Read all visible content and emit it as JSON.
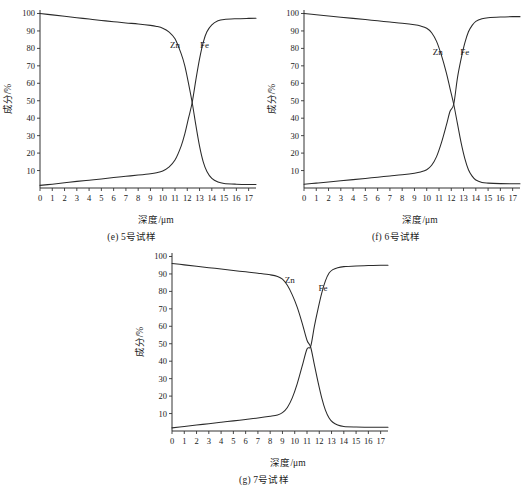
{
  "figure": {
    "background_color": "#ffffff",
    "line_color": "#2a2a2a",
    "panels": [
      "e",
      "f",
      "g"
    ]
  },
  "chart_data": [
    {
      "id": "e",
      "type": "line",
      "title": "",
      "caption": "(e) 5号试样",
      "xlabel": "深度/μm",
      "ylabel": "成分/%",
      "xlim": [
        0,
        17.6
      ],
      "ylim": [
        0,
        102
      ],
      "xticks": [
        0,
        1,
        2,
        3,
        4,
        5,
        6,
        7,
        8,
        9,
        10,
        11,
        12,
        13,
        14,
        15,
        16,
        17
      ],
      "xticklabels": [
        "0",
        "1",
        "2",
        "3",
        "4",
        "5",
        "6",
        "7",
        "8",
        "9",
        "10",
        "11",
        "12",
        "13",
        "14",
        "15",
        "16",
        "17"
      ],
      "yticks": [
        10,
        20,
        30,
        40,
        50,
        60,
        70,
        80,
        90,
        100
      ],
      "yticklabels": [
        "10",
        "20",
        "30",
        "40",
        "50",
        "60",
        "70",
        "80",
        "90",
        "100"
      ],
      "grid": false,
      "legend_position": "inline-annotation",
      "crossover": {
        "x": 12.4,
        "y": 49
      },
      "series": [
        {
          "name": "Zn",
          "label_position": {
            "x": 11.0,
            "y": 80
          },
          "x": [
            0,
            1,
            2,
            3,
            4,
            5,
            6,
            7,
            8,
            9,
            9.5,
            10,
            10.5,
            11,
            11.5,
            11.8,
            12.1,
            12.4,
            12.7,
            13,
            13.3,
            13.6,
            14,
            14.5,
            15,
            16,
            17,
            17.6
          ],
          "values": [
            100,
            99.2,
            98.4,
            97.6,
            96.8,
            96.0,
            95.3,
            94.6,
            94.0,
            93.2,
            92.6,
            91.6,
            89.5,
            85.5,
            77.0,
            70.0,
            60.0,
            49.0,
            36.0,
            24.0,
            15.0,
            9.5,
            5.5,
            3.4,
            2.6,
            2.2,
            2.0,
            2.0
          ]
        },
        {
          "name": "Fe",
          "label_position": {
            "x": 13.4,
            "y": 80
          },
          "x": [
            0,
            1,
            2,
            3,
            4,
            5,
            6,
            7,
            8,
            9,
            9.5,
            10,
            10.5,
            11,
            11.5,
            11.8,
            12.1,
            12.4,
            12.7,
            13,
            13.3,
            13.6,
            14,
            14.5,
            15,
            16,
            17,
            17.6
          ],
          "values": [
            1.5,
            2.2,
            3.0,
            3.8,
            4.5,
            5.2,
            6.0,
            6.7,
            7.4,
            8.2,
            8.8,
            9.8,
            12.0,
            16.0,
            24.0,
            31.0,
            40.0,
            49.0,
            62.0,
            74.0,
            83.5,
            89.5,
            93.5,
            95.8,
            96.6,
            97.0,
            97.2,
            97.3
          ]
        }
      ]
    },
    {
      "id": "f",
      "type": "line",
      "title": "",
      "caption": "(f) 6号试样",
      "xlabel": "深度/μm",
      "ylabel": "成分/%",
      "xlim": [
        0,
        17.6
      ],
      "ylim": [
        0,
        102
      ],
      "xticks": [
        0,
        1,
        2,
        3,
        4,
        5,
        6,
        7,
        8,
        9,
        10,
        11,
        12,
        13,
        14,
        15,
        16,
        17
      ],
      "xticklabels": [
        "0",
        "1",
        "2",
        "3",
        "4",
        "5",
        "6",
        "7",
        "8",
        "9",
        "10",
        "11",
        "12",
        "13",
        "14",
        "15",
        "16",
        "17"
      ],
      "yticks": [
        10,
        20,
        30,
        40,
        50,
        60,
        70,
        80,
        90,
        100
      ],
      "yticklabels": [
        "10",
        "20",
        "30",
        "40",
        "50",
        "60",
        "70",
        "80",
        "90",
        "100"
      ],
      "grid": false,
      "legend_position": "inline-annotation",
      "crossover": {
        "x": 12.2,
        "y": 48
      },
      "series": [
        {
          "name": "Zn",
          "label_position": {
            "x": 10.9,
            "y": 76
          },
          "x": [
            0,
            1,
            2,
            3,
            4,
            5,
            6,
            7,
            8,
            9,
            9.5,
            10,
            10.4,
            10.8,
            11.2,
            11.6,
            11.9,
            12.2,
            12.5,
            12.8,
            13.1,
            13.4,
            13.7,
            14,
            14.5,
            15,
            16,
            17,
            17.6
          ],
          "values": [
            100,
            99.3,
            98.6,
            97.9,
            97.2,
            96.5,
            95.8,
            95.1,
            94.4,
            93.5,
            92.8,
            91.5,
            89.0,
            84.0,
            76.0,
            66.0,
            57.0,
            48.0,
            37.0,
            26.0,
            17.0,
            10.5,
            6.8,
            4.6,
            3.2,
            2.8,
            2.5,
            2.4,
            2.4
          ]
        },
        {
          "name": "Fe",
          "label_position": {
            "x": 13.1,
            "y": 76
          },
          "x": [
            0,
            1,
            2,
            3,
            4,
            5,
            6,
            7,
            8,
            9,
            9.5,
            10,
            10.4,
            10.8,
            11.2,
            11.6,
            11.9,
            12.2,
            12.5,
            12.8,
            13.1,
            13.4,
            13.7,
            14,
            14.5,
            15,
            16,
            17,
            17.6
          ],
          "values": [
            2.2,
            2.8,
            3.4,
            4.1,
            4.8,
            5.5,
            6.2,
            6.9,
            7.6,
            8.5,
            9.2,
            10.5,
            13.0,
            18.0,
            26.0,
            36.0,
            44.0,
            48.0,
            63.0,
            74.0,
            83.0,
            89.5,
            93.2,
            95.5,
            97.0,
            97.6,
            98.0,
            98.2,
            98.2
          ]
        }
      ]
    },
    {
      "id": "g",
      "type": "line",
      "title": "",
      "caption": "(g) 7号试样",
      "xlabel": "深度/μm",
      "ylabel": "成分/%",
      "xlim": [
        0,
        17.6
      ],
      "ylim": [
        0,
        102
      ],
      "xticks": [
        0,
        1,
        2,
        3,
        4,
        5,
        6,
        7,
        8,
        9,
        10,
        11,
        12,
        13,
        14,
        15,
        16,
        17
      ],
      "xticklabels": [
        "0",
        "1",
        "2",
        "3",
        "4",
        "5",
        "6",
        "7",
        "8",
        "9",
        "10",
        "11",
        "12",
        "13",
        "14",
        "15",
        "16",
        "17"
      ],
      "yticks": [
        10,
        20,
        30,
        40,
        50,
        60,
        70,
        80,
        90,
        100
      ],
      "yticklabels": [
        "10",
        "20",
        "30",
        "40",
        "50",
        "60",
        "70",
        "80",
        "90",
        "100"
      ],
      "grid": false,
      "legend_position": "inline-annotation",
      "crossover": {
        "x": 11.3,
        "y": 48
      },
      "series": [
        {
          "name": "Zn",
          "label_position": {
            "x": 9.6,
            "y": 85
          },
          "x": [
            0,
            1,
            2,
            3,
            4,
            5,
            6,
            7,
            8,
            8.6,
            9,
            9.4,
            9.8,
            10.2,
            10.6,
            11.0,
            11.3,
            11.6,
            11.9,
            12.2,
            12.5,
            12.8,
            13.1,
            13.5,
            14,
            15,
            16,
            17,
            17.6
          ],
          "values": [
            96,
            95.2,
            94.4,
            93.6,
            92.8,
            92.0,
            91.2,
            90.4,
            89.5,
            88.6,
            87.0,
            83.5,
            78.0,
            71.0,
            62.0,
            52.0,
            48.0,
            38.0,
            28.0,
            19.0,
            12.0,
            7.5,
            5.0,
            3.4,
            2.6,
            2.3,
            2.2,
            2.2,
            2.2
          ]
        },
        {
          "name": "Fe",
          "label_position": {
            "x": 12.3,
            "y": 80
          },
          "x": [
            0,
            1,
            2,
            3,
            4,
            5,
            6,
            7,
            8,
            8.6,
            9,
            9.4,
            9.8,
            10.2,
            10.6,
            11.0,
            11.3,
            11.6,
            11.9,
            12.2,
            12.5,
            12.8,
            13.1,
            13.5,
            14,
            15,
            16,
            17,
            17.6
          ],
          "values": [
            1.8,
            2.6,
            3.4,
            4.2,
            5.0,
            5.8,
            6.6,
            7.4,
            8.4,
            9.2,
            10.5,
            13.5,
            19.0,
            27.0,
            37.0,
            47.0,
            48.5,
            60.0,
            70.0,
            79.0,
            86.0,
            90.5,
            92.5,
            93.6,
            94.2,
            94.6,
            94.8,
            95.0,
            95.0
          ]
        }
      ]
    }
  ]
}
